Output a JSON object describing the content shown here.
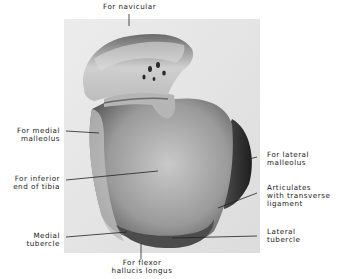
{
  "figure": {
    "labels": {
      "navicular": "For navicular",
      "medial_malleolus": "For medial\nmalleolus",
      "inferior_tibia": "For inferior\nend of tibia",
      "medial_tubercle": "Medial\ntubercle",
      "flexor_hallucis": "For flexor\nhallucis longus",
      "lateral_malleolus": "For lateral\nmalleolus",
      "transverse_ligament": "Articulates\nwith transverse\nligament",
      "lateral_tubercle": "Lateral\ntubercle"
    },
    "colors": {
      "background": "#ffffff",
      "photo_bg": "#e4e4e4",
      "bone_light": "#d2d2d2",
      "bone_dark": "#3a3a3a",
      "leader_line": "#222222"
    }
  }
}
